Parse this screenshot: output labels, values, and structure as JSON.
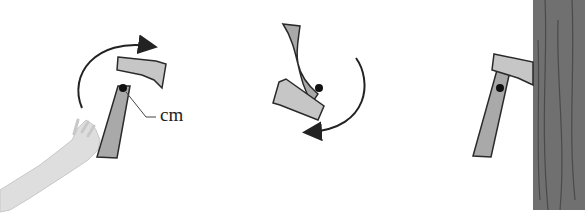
{
  "figure": {
    "panels": [
      {
        "id": "toss",
        "description": "Hand tossing axe, rotating clockwise"
      },
      {
        "id": "flight",
        "description": "Axe rotating mid-air"
      },
      {
        "id": "impact",
        "description": "Axe embedded in tree"
      }
    ],
    "labels": {
      "center_of_mass": "cm"
    },
    "colors": {
      "axe_fill": "#a9a9a9",
      "axe_head": "#c4c4c4",
      "outline": "#2a2a2a",
      "tree": "#6e6e6e",
      "arm": "#dcdcdc",
      "cm_dot": "#111111"
    }
  }
}
